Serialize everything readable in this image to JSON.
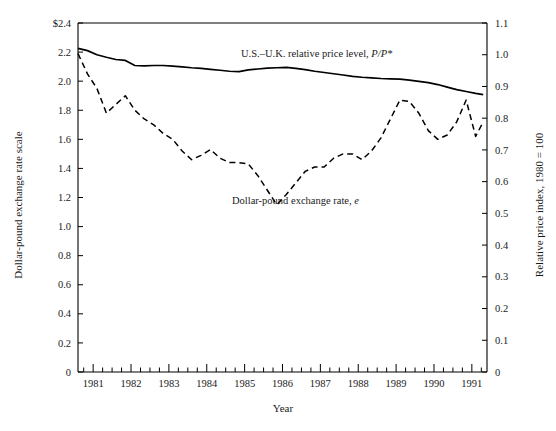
{
  "chart_data": {
    "type": "line",
    "title": "",
    "xlabel": "Year",
    "ylabel": "Dollar-pound exchange rate scale",
    "y2label": "Relative price index, 1980 = 100",
    "grid": false,
    "legend": "inline-annotations",
    "xlim": [
      1980.6,
      1991.4
    ],
    "ylim": [
      0,
      2.4
    ],
    "y2lim": [
      0,
      1.1
    ],
    "x_major_ticks": [
      1981,
      1982,
      1983,
      1984,
      1985,
      1986,
      1987,
      1988,
      1989,
      1990,
      1991
    ],
    "x_tick_labels": [
      "1981",
      "1982",
      "1983",
      "1984",
      "1985",
      "1986",
      "1987",
      "1988",
      "1989",
      "1990",
      "1991"
    ],
    "x_minor_ticks_per_year": 4,
    "y_ticks": [
      0,
      0.2,
      0.4,
      0.6,
      0.8,
      1.0,
      1.2,
      1.4,
      1.6,
      1.8,
      2.0,
      2.2,
      2.4
    ],
    "y_tick_labels": [
      "0",
      "0.2",
      "0.4",
      "0.6",
      "0.8",
      "1.0",
      "1.2",
      "1.4",
      "1.6",
      "1.8",
      "2.0",
      "2.2",
      "$2.4"
    ],
    "y2_ticks": [
      0,
      0.1,
      0.2,
      0.3,
      0.4,
      0.5,
      0.6,
      0.7,
      0.8,
      0.9,
      1.0,
      1.1
    ],
    "y2_tick_labels": [
      "0",
      "0.1",
      "0.2",
      "0.3",
      "0.4",
      "0.5",
      "0.6",
      "0.7",
      "0.8",
      "0.9",
      "1.0",
      "1.1"
    ],
    "series": [
      {
        "name": "U.S.-U.K. relative price level, P/P*",
        "axis": "right",
        "style": "solid",
        "color": "#000000",
        "x": [
          1980.6,
          1980.85,
          1981.1,
          1981.35,
          1981.6,
          1981.85,
          1982.1,
          1982.35,
          1982.6,
          1982.85,
          1983.1,
          1983.35,
          1983.6,
          1983.85,
          1984.1,
          1984.35,
          1984.6,
          1984.85,
          1985.1,
          1985.35,
          1985.6,
          1985.85,
          1986.1,
          1986.35,
          1986.6,
          1986.85,
          1987.1,
          1987.35,
          1987.6,
          1987.85,
          1988.1,
          1988.35,
          1988.6,
          1988.85,
          1989.1,
          1989.35,
          1989.6,
          1989.85,
          1990.1,
          1990.35,
          1990.6,
          1990.85,
          1991.1,
          1991.3
        ],
        "values": [
          1.02,
          1.013,
          1.0,
          0.992,
          0.985,
          0.982,
          0.966,
          0.965,
          0.966,
          0.966,
          0.964,
          0.962,
          0.959,
          0.957,
          0.954,
          0.951,
          0.948,
          0.947,
          0.952,
          0.955,
          0.958,
          0.959,
          0.96,
          0.957,
          0.953,
          0.948,
          0.944,
          0.94,
          0.936,
          0.932,
          0.929,
          0.927,
          0.925,
          0.924,
          0.923,
          0.92,
          0.916,
          0.912,
          0.906,
          0.898,
          0.89,
          0.884,
          0.878,
          0.874
        ]
      },
      {
        "name": "Dollar-pound exchange rate, e",
        "axis": "left",
        "style": "dashed",
        "color": "#000000",
        "x": [
          1980.6,
          1980.85,
          1981.1,
          1981.35,
          1981.6,
          1981.85,
          1982.1,
          1982.35,
          1982.6,
          1982.85,
          1983.1,
          1983.35,
          1983.6,
          1983.85,
          1984.1,
          1984.35,
          1984.6,
          1984.85,
          1985.1,
          1985.35,
          1985.6,
          1985.85,
          1986.1,
          1986.35,
          1986.6,
          1986.85,
          1987.1,
          1987.35,
          1987.6,
          1987.85,
          1988.1,
          1988.35,
          1988.6,
          1988.85,
          1989.1,
          1989.35,
          1989.6,
          1989.85,
          1990.1,
          1990.35,
          1990.6,
          1990.85,
          1991.1,
          1991.3
        ],
        "values": [
          2.19,
          2.05,
          1.95,
          1.78,
          1.84,
          1.9,
          1.8,
          1.74,
          1.7,
          1.64,
          1.6,
          1.52,
          1.46,
          1.49,
          1.53,
          1.47,
          1.44,
          1.44,
          1.43,
          1.35,
          1.25,
          1.15,
          1.22,
          1.3,
          1.38,
          1.41,
          1.41,
          1.47,
          1.5,
          1.5,
          1.46,
          1.52,
          1.61,
          1.74,
          1.87,
          1.86,
          1.78,
          1.66,
          1.6,
          1.63,
          1.72,
          1.87,
          1.62,
          1.72
        ]
      }
    ],
    "annotations": [
      {
        "text": "U.S.–U.K. relative price level, ",
        "text_italic": "P/P*",
        "x": 1985.4,
        "y": 1.03
      },
      {
        "text": "Dollar-pound exchange rate, ",
        "text_italic": "e",
        "x": 1985.1,
        "y": 0.48
      }
    ]
  },
  "axes": {
    "left_title": "Dollar-pound exchange rate scale",
    "right_title": "Relative price index, 1980 = 100",
    "x_title": "Year"
  },
  "annotation_labels": {
    "price_level_main": "U.S.–U.K. relative price level, ",
    "price_level_italic": "P/P*",
    "exchange_rate_main": "Dollar-pound exchange rate, ",
    "exchange_rate_italic": "e"
  }
}
